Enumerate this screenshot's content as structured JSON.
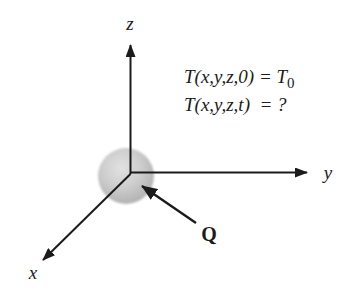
{
  "diagram": {
    "background": "#ffffff",
    "ink_color": "#1b1b1b",
    "sphere": {
      "gradient": [
        "#e2e2e2",
        "#cdcdcd",
        "#b4b4b4",
        "#9e9e9e"
      ]
    },
    "axis_labels": {
      "x": "x",
      "y": "y",
      "z": "z"
    },
    "source_label": "Q",
    "equations": {
      "line1": {
        "before_sub": "T(x,y,z,0) = T",
        "sub": "0"
      },
      "line2": {
        "text": "T(x,y,z,t)  = ?"
      }
    }
  }
}
